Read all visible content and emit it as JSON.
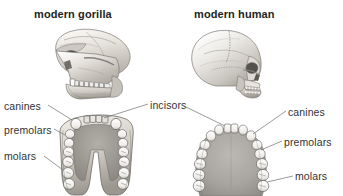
{
  "figure": {
    "kind": "comparative-anatomy-diagram",
    "background_color": "#ffffff",
    "text_color": "#231f20",
    "leader_line_color": "#6f6f6f",
    "bone_color": "#e9e6e1",
    "palate_color": "#a8a8a8",
    "tooth_color": "#f6f5f2"
  },
  "titles": {
    "left": "modern gorilla",
    "right": "modern human"
  },
  "labels": {
    "canines_left": "canines",
    "premolars_left": "premolars",
    "molars_left": "molars",
    "incisors": "incisors",
    "canines_right": "canines",
    "premolars_right": "premolars",
    "molars_right": "molars"
  },
  "specimens": [
    {
      "name": "gorilla-skull-lateral",
      "view": "lateral",
      "column": "left",
      "row": "top"
    },
    {
      "name": "gorilla-mandible-occlusal",
      "view": "occlusal",
      "column": "left",
      "row": "bottom",
      "arch_shape": "U-shaped with parallel tooth rows"
    },
    {
      "name": "human-skull-lateral",
      "view": "lateral",
      "column": "right",
      "row": "top"
    },
    {
      "name": "human-palate-occlusal",
      "view": "occlusal",
      "column": "right",
      "row": "bottom",
      "arch_shape": "parabolic arch"
    }
  ]
}
